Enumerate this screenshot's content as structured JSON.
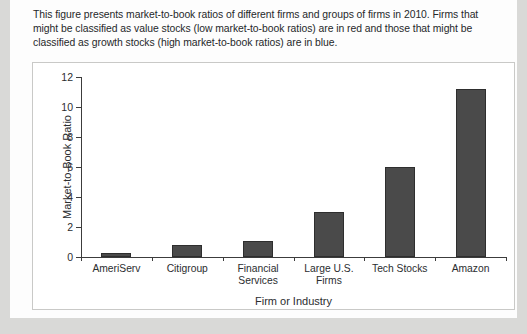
{
  "caption": {
    "text": "This figure presents market-to-book ratios of different firms and groups of firms in 2010. Firms that might be classified as value stocks (low market-to-book ratios) are in red and those that might be classified as growth stocks (high market-to-book ratios) are in blue."
  },
  "chart_data": {
    "type": "bar",
    "title": "",
    "xlabel": "Firm or Industry",
    "ylabel": "Market-to-Book Ratio",
    "categories": [
      "AmeriServ",
      "Citigroup",
      "Financial Services",
      "Large U.S. Firms",
      "Tech Stocks",
      "Amazon"
    ],
    "category_lines": [
      [
        "AmeriServ"
      ],
      [
        "Citigroup"
      ],
      [
        "Financial",
        "Services"
      ],
      [
        "Large U.S.",
        "Firms"
      ],
      [
        "Tech Stocks"
      ],
      [
        "Amazon"
      ]
    ],
    "values": [
      0.3,
      0.8,
      1.1,
      3.0,
      6.0,
      11.2
    ],
    "ylim": [
      0,
      12
    ],
    "yticks": [
      0,
      2,
      4,
      6,
      8,
      10,
      12
    ],
    "grid": false,
    "legend": "none",
    "bar_color": "#4a4a4a",
    "bar_edge_color": "#2e2e2e"
  },
  "colors": {
    "page_background": "#d9d9d7",
    "sheet_background": "#fdfdfd",
    "panel_background": "#ffffff",
    "panel_border": "#c9c9c7",
    "axis": "#3c3c3c",
    "text": "#2b2d2f"
  }
}
